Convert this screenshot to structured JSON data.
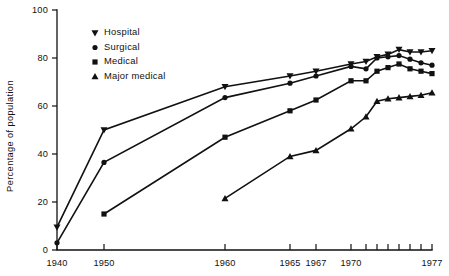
{
  "chart_data": {
    "type": "line",
    "title": "",
    "subtitle": "",
    "xlabel": "",
    "ylabel": "Percentage of population",
    "ylim": [
      0,
      100
    ],
    "xlim": [
      1940,
      1977
    ],
    "yticks": [
      0,
      20,
      40,
      60,
      80,
      100
    ],
    "ytick_labels": [
      "0",
      "20",
      "40",
      "60",
      "80",
      "100"
    ],
    "xticks": [
      1940,
      1950,
      1960,
      1965,
      1967,
      1970,
      1971,
      1972,
      1973,
      1974,
      1975,
      1976,
      1977
    ],
    "xtick_labels": [
      "1940",
      "1950",
      "1960",
      "1965",
      "1967",
      "1970",
      "",
      "",
      "",
      "",
      "",
      "",
      "1977"
    ],
    "grid": false,
    "legend_position": "top-left",
    "series": [
      {
        "name": "Hospital",
        "marker": "triangle-down",
        "x": [
          1940,
          1950,
          1960,
          1965,
          1967,
          1970,
          1971,
          1972,
          1973,
          1974,
          1975,
          1976,
          1977
        ],
        "values": [
          9.5,
          50.0,
          68.0,
          72.5,
          74.5,
          77.5,
          78.5,
          80.5,
          81.5,
          83.5,
          82.5,
          82.5,
          83.0
        ]
      },
      {
        "name": "Surgical",
        "marker": "circle",
        "x": [
          1940,
          1950,
          1960,
          1965,
          1967,
          1970,
          1971,
          1972,
          1973,
          1974,
          1975,
          1976,
          1977
        ],
        "values": [
          3.0,
          36.5,
          63.5,
          69.5,
          72.5,
          76.5,
          75.5,
          80.0,
          80.5,
          81.0,
          79.5,
          78.0,
          77.0
        ]
      },
      {
        "name": "Medical",
        "marker": "square",
        "x": [
          1940,
          1950,
          1960,
          1965,
          1967,
          1970,
          1971,
          1972,
          1973,
          1974,
          1975,
          1976,
          1977
        ],
        "values": [
          null,
          15.0,
          47.0,
          58.0,
          62.5,
          70.5,
          70.5,
          74.5,
          76.0,
          77.5,
          75.5,
          74.5,
          73.5
        ]
      },
      {
        "name": "Major medical",
        "marker": "triangle-up",
        "x": [
          1960,
          1965,
          1967,
          1970,
          1971,
          1972,
          1973,
          1974,
          1975,
          1976,
          1977
        ],
        "values": [
          21.5,
          39.0,
          41.5,
          50.5,
          55.5,
          62.0,
          63.0,
          63.5,
          64.0,
          64.5,
          65.5
        ]
      }
    ]
  },
  "legend": {
    "entries": [
      {
        "label": "Hospital",
        "marker": "triangle-down"
      },
      {
        "label": "Surgical",
        "marker": "circle"
      },
      {
        "label": "Medical",
        "marker": "square"
      },
      {
        "label": "Major medical",
        "marker": "triangle-up"
      }
    ]
  },
  "colors": {
    "ink": "#111111",
    "background": "#ffffff"
  }
}
